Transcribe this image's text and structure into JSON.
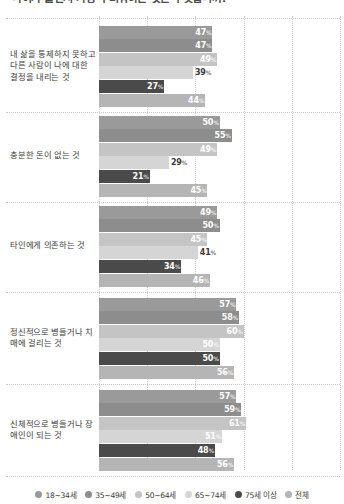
{
  "title": "나이가 들면서 가장 두려워하는 것은 무엇입니까?",
  "legend": {
    "position": "bottom",
    "items": [
      {
        "label": "18~34세",
        "color": "#9a9a9a"
      },
      {
        "label": "35~49세",
        "color": "#8d8d8d"
      },
      {
        "label": "50~64세",
        "color": "#c4c4c4"
      },
      {
        "label": "65~74세",
        "color": "#d5d5d5"
      },
      {
        "label": "75세 이상",
        "color": "#4a4a4a"
      },
      {
        "label": "전체",
        "color": "#b5b5b5"
      }
    ]
  },
  "chart_data": {
    "type": "bar",
    "orientation": "horizontal",
    "title": "나이가 들면서 가장 두려워하는 것은 무엇입니까?",
    "xlabel": "",
    "ylabel": "",
    "xlim": [
      0,
      100
    ],
    "grid": true,
    "value_suffix": "%",
    "categories": [
      "내 삶을 통제하지 못하고 다른 사람이 나에 대한 결정을 내리는 것",
      "충분한 돈이 없는 것",
      "타인에게 의존하는 것",
      "정신적으로 병들거나 치매에 걸리는 것",
      "신체적으로 병들거나 장애인이 되는 것"
    ],
    "series": [
      {
        "name": "18~34세",
        "color": "#9a9a9a",
        "values": [
          47,
          50,
          49,
          57,
          57
        ]
      },
      {
        "name": "35~49세",
        "color": "#8d8d8d",
        "values": [
          47,
          55,
          50,
          58,
          59
        ]
      },
      {
        "name": "50~64세",
        "color": "#c4c4c4",
        "values": [
          49,
          49,
          45,
          60,
          61
        ]
      },
      {
        "name": "65~74세",
        "color": "#d5d5d5",
        "values": [
          39,
          29,
          41,
          50,
          51
        ]
      },
      {
        "name": "75세 이상",
        "color": "#4a4a4a",
        "values": [
          27,
          21,
          34,
          50,
          48
        ]
      },
      {
        "name": "전체",
        "color": "#b5b5b5",
        "values": [
          44,
          45,
          46,
          56,
          56
        ]
      }
    ]
  }
}
